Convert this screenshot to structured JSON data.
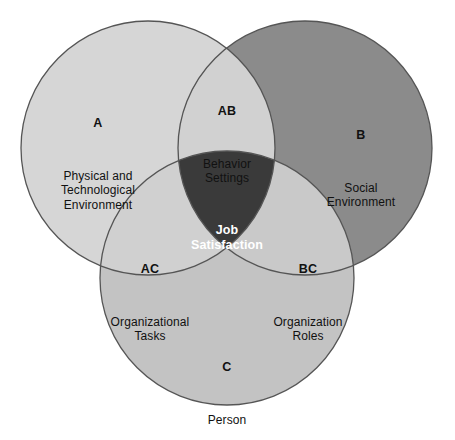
{
  "diagram": {
    "type": "venn-3-circle",
    "background_color": "#ffffff",
    "stroke_color": "#555555",
    "colors": {
      "circle_a": "#d6d6d6",
      "circle_b": "#8b8b8b",
      "circle_c": "#c3c3c3",
      "overlap_ab": "#d1d1d1",
      "overlap_ac": "#d0d0d0",
      "overlap_bc": "#c9c9c9",
      "overlap_abc": "#3a3a3a",
      "label_text": "#111111",
      "label_text_on_dark": "#ffffff"
    },
    "geometry": {
      "radius": 127,
      "circle_a_center": [
        148,
        148
      ],
      "circle_b_center": [
        305,
        148
      ],
      "circle_c_center": [
        227,
        278
      ]
    },
    "regions": [
      {
        "id": "A",
        "tag": "A",
        "description": "Physical and\nTechnological\nEnvironment",
        "fill": "#d6d6d6"
      },
      {
        "id": "AB",
        "tag": "AB",
        "description": "Behavior\nSettings",
        "fill": "#d1d1d1"
      },
      {
        "id": "B",
        "tag": "B",
        "description": "Social\nEnvironment",
        "fill": "#8b8b8b"
      },
      {
        "id": "AC",
        "tag": "AC",
        "description": "Organizational\nTasks",
        "fill": "#d0d0d0"
      },
      {
        "id": "ABC",
        "tag": "",
        "description": "Job\nSatisfaction",
        "fill": "#3a3a3a"
      },
      {
        "id": "BC",
        "tag": "BC",
        "description": "Organization\nRoles",
        "fill": "#c9c9c9"
      },
      {
        "id": "C",
        "tag": "C",
        "description": "Person",
        "fill": "#c3c3c3"
      }
    ]
  }
}
